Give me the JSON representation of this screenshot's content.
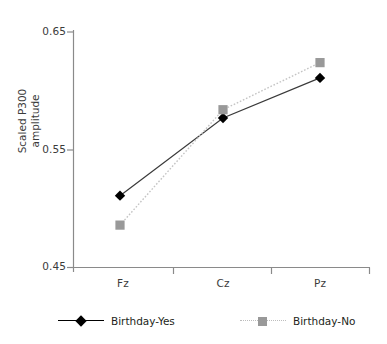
{
  "chart_data": {
    "type": "line",
    "title": "",
    "xlabel": "",
    "ylabel": "Scaled P300\namplitude",
    "categories": [
      "Fz",
      "Cz",
      "Pz"
    ],
    "ylim": [
      0.45,
      0.65
    ],
    "yticks": [
      "0.45",
      "0.55",
      "0.65"
    ],
    "ytick_values": [
      0.45,
      0.55,
      0.65
    ],
    "grid": false,
    "legend_position": "bottom",
    "series": [
      {
        "name": "Birthday-Yes",
        "values": [
          0.511,
          0.577,
          0.611
        ],
        "color": "#000000",
        "marker": "diamond",
        "linestyle": "solid"
      },
      {
        "name": "Birthday-No",
        "values": [
          0.486,
          0.584,
          0.624
        ],
        "color": "#999999",
        "marker": "square",
        "linestyle": "dotted"
      }
    ]
  },
  "axis": {
    "line_color": "#8a8a8a",
    "y_title": "Scaled P300\namplitude"
  },
  "legend": {
    "items": [
      {
        "label": "Birthday-Yes"
      },
      {
        "label": "Birthday-No"
      }
    ]
  }
}
